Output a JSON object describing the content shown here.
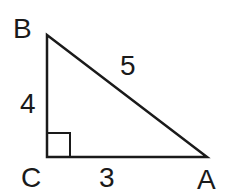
{
  "diagram": {
    "type": "right-triangle",
    "vertices": {
      "B": {
        "label": "B"
      },
      "C": {
        "label": "C"
      },
      "A": {
        "label": "A"
      }
    },
    "sides": {
      "BC": {
        "label": "4"
      },
      "CA": {
        "label": "3"
      },
      "BA": {
        "label": "5"
      }
    },
    "right_angle_at": "C",
    "stroke_color": "#1a1a1a",
    "background": "#ffffff"
  }
}
